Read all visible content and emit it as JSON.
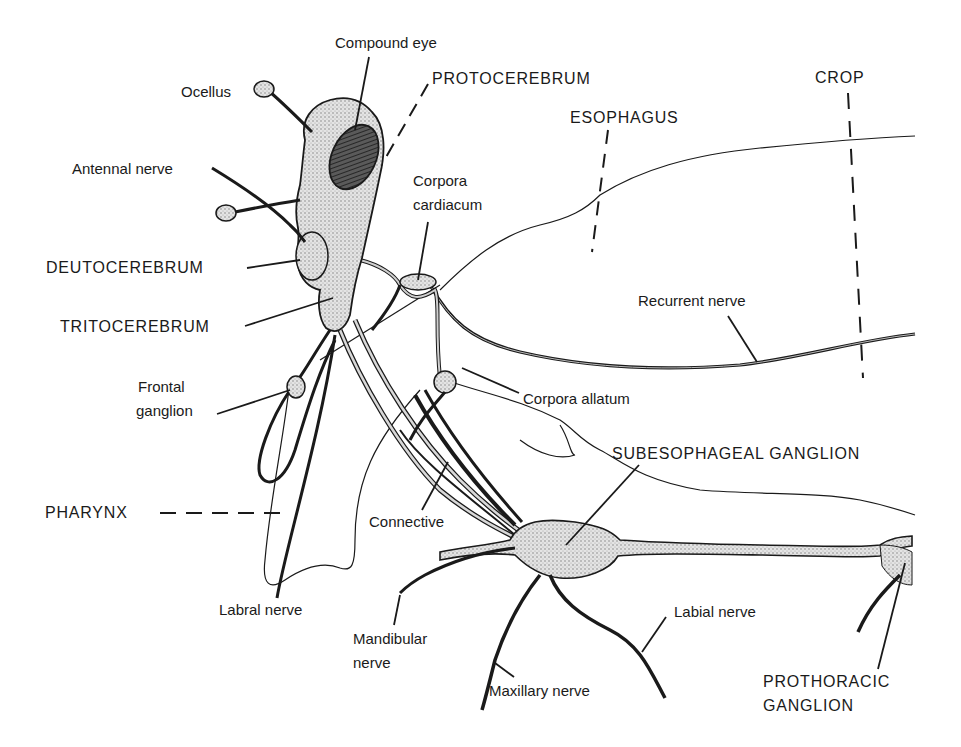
{
  "diagram": {
    "type": "anatomical illustration",
    "labels": {
      "compound_eye": "Compound eye",
      "protocerebrum": "PROTOCEREBRUM",
      "ocellus": "Ocellus",
      "esophagus": "ESOPHAGUS",
      "crop": "CROP",
      "antennal_nerve": "Antennal nerve",
      "corpora_cardiacum_line1": "Corpora",
      "corpora_cardiacum_line2": "cardiacum",
      "deutocerebrum": "DEUTOCEREBRUM",
      "tritocerebrum": "TRITOCEREBRUM",
      "recurrent_nerve": "Recurrent nerve",
      "frontal_ganglion_line1": "Frontal",
      "frontal_ganglion_line2": "ganglion",
      "corpora_allatum": "Corpora allatum",
      "subesophageal_ganglion": "SUBESOPHAGEAL GANGLION",
      "pharynx": "PHARYNX",
      "connective": "Connective",
      "labral_nerve": "Labral nerve",
      "labial_nerve": "Labial nerve",
      "mandibular_nerve_line1": "Mandibular",
      "mandibular_nerve_line2": "nerve",
      "maxillary_nerve": "Maxillary nerve",
      "prothoracic_ganglion_line1": "PROTHORACIC",
      "prothoracic_ganglion_line2": "GANGLION"
    },
    "colors": {
      "ink": "#1a1a1a",
      "stipple": "#8a8a8a",
      "eye": "#3a3a3a",
      "background": "#ffffff"
    }
  }
}
